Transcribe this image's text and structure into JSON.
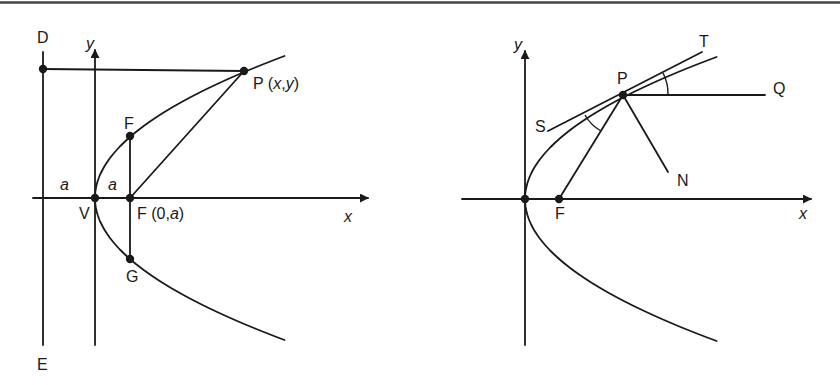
{
  "figure": {
    "top_rule": true,
    "stroke_color": "#1a1a1a",
    "background": "#ffffff"
  },
  "left_diagram": {
    "title": "Parabola with focus, directrix and latus rectum",
    "labels": {
      "directrix_top": "D",
      "directrix_bottom": "E",
      "y_axis": "y",
      "x_axis": "x",
      "point_p_name": "P",
      "point_p_coords_open": " (",
      "point_p_x": "x",
      "point_p_comma": ",",
      "point_p_y": "y",
      "point_p_coords_close": ")",
      "latus_top": "F",
      "latus_bottom": "G",
      "vertex": "V",
      "focus_name": "F",
      "focus_coords_open": " (0,",
      "focus_coords_a": "a",
      "focus_coords_close": ")",
      "dist_left": "a",
      "dist_right": "a"
    },
    "points": {
      "D": [
        43,
        69
      ],
      "V": [
        95,
        198
      ],
      "F": [
        130,
        198
      ],
      "F_top": [
        130,
        136
      ],
      "G": [
        130,
        259
      ],
      "P": [
        244,
        71
      ]
    }
  },
  "right_diagram": {
    "title": "Reflective property of the parabola",
    "labels": {
      "y_axis": "y",
      "x_axis": "x",
      "point_p": "P",
      "tangent_end": "T",
      "tangent_start": "S",
      "horizontal_ray": "Q",
      "normal": "N",
      "focus": "F"
    },
    "points": {
      "V": [
        525,
        199
      ],
      "F": [
        559,
        199
      ],
      "P": [
        623,
        95
      ],
      "S": [
        548,
        131
      ],
      "T": [
        702,
        52
      ],
      "Q": [
        765,
        95
      ],
      "N": [
        668,
        172
      ]
    }
  }
}
